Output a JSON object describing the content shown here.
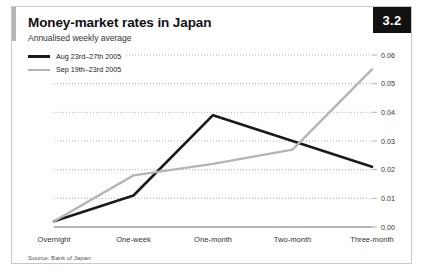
{
  "figure": {
    "badge": "3.2",
    "title": "Money-market rates in Japan",
    "subtitle": "Annualised weekly average",
    "source": "Source: Bank of Japan"
  },
  "legend": [
    {
      "label": "Aug 23rd–27th 2005",
      "color": "#1a1a1a",
      "style": "dark"
    },
    {
      "label": "Sep 19th–23rd 2005",
      "color": "#b5b5b5",
      "style": "light"
    }
  ],
  "chart_data": {
    "type": "line",
    "title": "Money-market rates in Japan",
    "subtitle": "Annualised weekly average",
    "xlabel": "",
    "ylabel": "",
    "categories": [
      "Overnight",
      "One-week",
      "One-month",
      "Two-month",
      "Three-month"
    ],
    "ylim": [
      0.0,
      0.06
    ],
    "yticks": [
      0.0,
      0.01,
      0.02,
      0.03,
      0.04,
      0.05,
      0.06
    ],
    "ytick_labels": [
      "0.00",
      "0.01",
      "0.02",
      "0.03",
      "0.04",
      "0.05",
      "0.06"
    ],
    "y_axis_position": "right",
    "grid": "horizontal-dotted",
    "legend_position": "top-left",
    "series": [
      {
        "name": "Aug 23rd–27th 2005",
        "color": "#1a1a1a",
        "values": [
          0.002,
          0.011,
          0.039,
          0.03,
          0.021
        ]
      },
      {
        "name": "Sep 19th–23rd 2005",
        "color": "#b5b5b5",
        "values": [
          0.002,
          0.018,
          0.022,
          0.027,
          0.055
        ]
      }
    ],
    "source": "Source: Bank of Japan"
  }
}
